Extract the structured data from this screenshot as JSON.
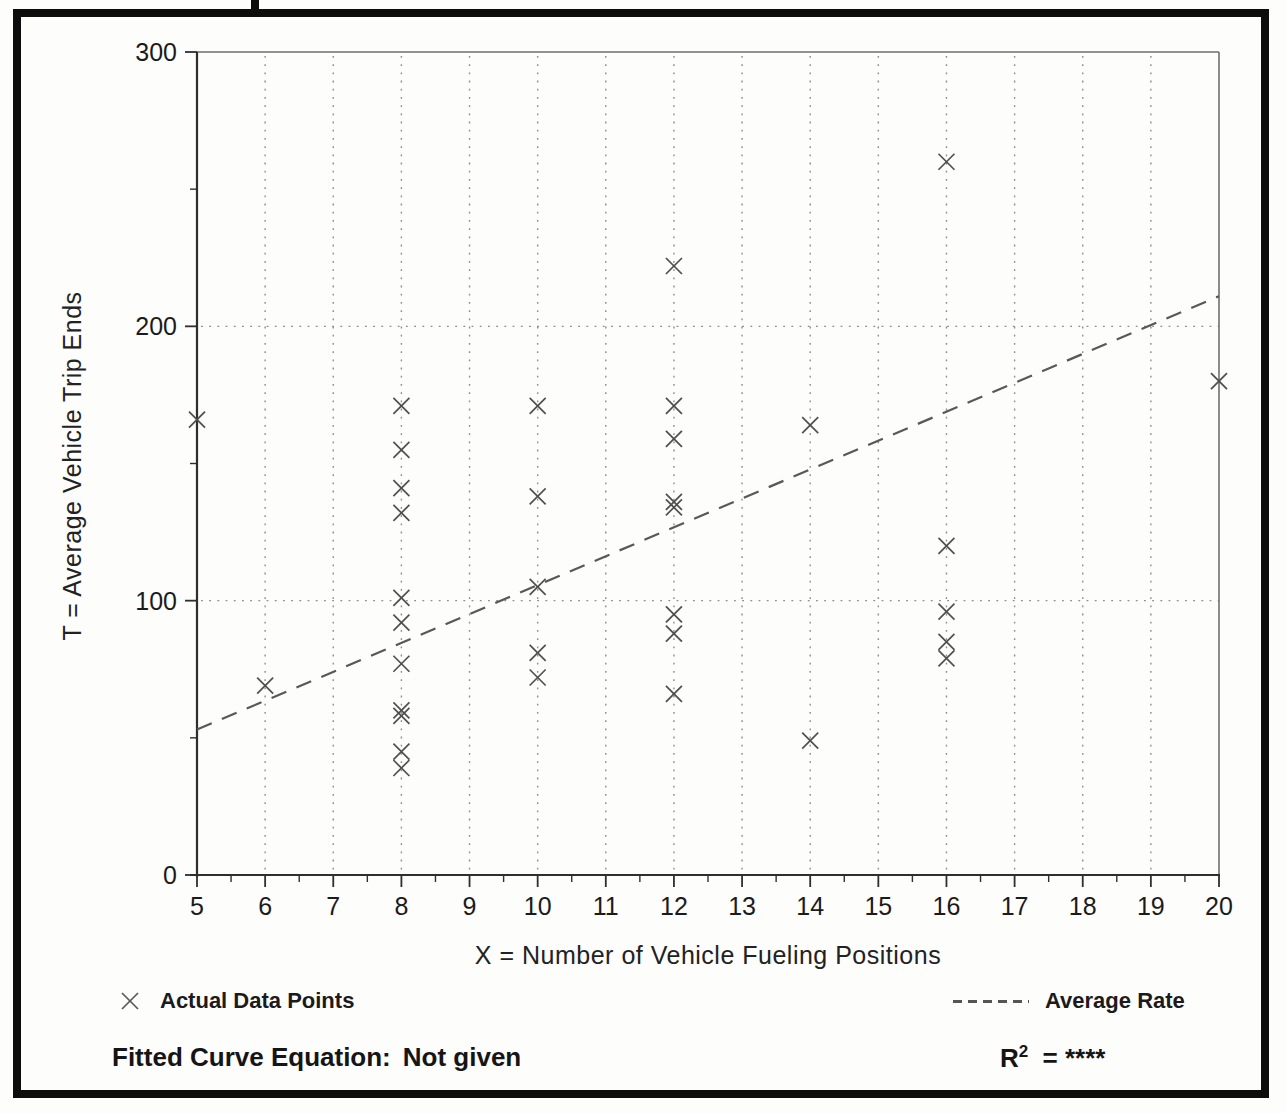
{
  "colors": {
    "ink": "#1b1b1b",
    "axis": "#2e2e2e",
    "plot_border": "#6f6f6f",
    "grid": "#8c8c8c",
    "marker": "#4f4f4f",
    "trend": "#585858",
    "frame": "#0d0d0d",
    "paper": "#fdfdfc"
  },
  "chart_data": {
    "type": "scatter",
    "title": "",
    "xlabel": "X = Number of Vehicle Fueling Positions",
    "ylabel": "T = Average Vehicle Trip Ends",
    "xlim": [
      5,
      20
    ],
    "ylim": [
      0,
      300
    ],
    "xticks": [
      5,
      6,
      7,
      8,
      9,
      10,
      11,
      12,
      13,
      14,
      15,
      16,
      17,
      18,
      19,
      20
    ],
    "yticks": [
      0,
      100,
      200,
      300
    ],
    "x_minor_step": 0.5,
    "y_minor_step": 50,
    "grid_x": [
      6,
      7,
      8,
      9,
      10,
      11,
      12,
      13,
      14,
      15,
      16,
      17,
      18,
      19
    ],
    "grid_y": [
      100,
      200
    ],
    "legend_position": "below",
    "series": [
      {
        "name": "Actual Data Points",
        "kind": "scatter",
        "marker": "x",
        "points": [
          [
            5,
            166
          ],
          [
            6,
            69
          ],
          [
            8,
            171
          ],
          [
            8,
            155
          ],
          [
            8,
            141
          ],
          [
            8,
            132
          ],
          [
            8,
            101
          ],
          [
            8,
            92
          ],
          [
            8,
            77
          ],
          [
            8,
            60
          ],
          [
            8,
            58
          ],
          [
            8,
            45
          ],
          [
            8,
            39
          ],
          [
            10,
            171
          ],
          [
            10,
            138
          ],
          [
            10,
            105
          ],
          [
            10,
            81
          ],
          [
            10,
            72
          ],
          [
            12,
            222
          ],
          [
            12,
            171
          ],
          [
            12,
            159
          ],
          [
            12,
            136
          ],
          [
            12,
            134
          ],
          [
            12,
            95
          ],
          [
            12,
            88
          ],
          [
            12,
            66
          ],
          [
            14,
            164
          ],
          [
            14,
            49
          ],
          [
            16,
            260
          ],
          [
            16,
            120
          ],
          [
            16,
            96
          ],
          [
            16,
            85
          ],
          [
            16,
            79
          ],
          [
            20,
            180
          ]
        ]
      },
      {
        "name": "Average Rate",
        "kind": "line",
        "dashed": true,
        "points": [
          [
            5,
            53
          ],
          [
            20,
            211
          ]
        ]
      }
    ]
  },
  "legend": {
    "points_label": "Actual Data Points",
    "rate_label": "Average Rate"
  },
  "footer": {
    "equation_label": "Fitted Curve Equation:",
    "equation_value": "Not given",
    "r2_base": "R",
    "r2_sup": "2",
    "r2_rest": "= ****"
  }
}
